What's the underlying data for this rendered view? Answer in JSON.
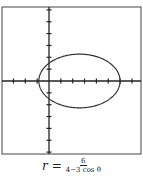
{
  "chart_data": {
    "type": "line",
    "title": "",
    "equation": "r = 6/(4 - 3 cos θ)",
    "curve": "ellipse",
    "polar": true,
    "eccentricity": 0.75,
    "vertices_x": [
      -0.857,
      6.0
    ],
    "center_x": 2.571,
    "semi_major": 3.429,
    "semi_minor": 2.268,
    "xlim": [
      -4,
      7.7
    ],
    "ylim": [
      -6.2,
      6.2
    ],
    "x_ticks": [
      -3,
      -2,
      -1,
      1,
      2,
      3,
      4,
      5,
      6,
      7
    ],
    "y_ticks": [
      -6,
      -5,
      -4,
      -3,
      -2,
      -1,
      1,
      2,
      3,
      4,
      5,
      6
    ],
    "grid": false,
    "xlabel": "",
    "ylabel": ""
  },
  "caption": {
    "lhs": "r =",
    "numerator": "6",
    "denominator": "4−3 cos θ"
  },
  "style": {
    "axis_color": "#222222",
    "curve_color": "#333333",
    "frame_color": "#444444"
  }
}
